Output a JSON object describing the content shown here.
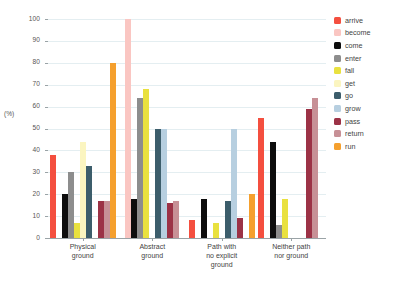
{
  "chart_data": {
    "type": "bar",
    "title": "",
    "subtitle": "",
    "xlabel": "",
    "ylabel": "(%)",
    "ylim": [
      0,
      100
    ],
    "ytick_values": [
      0,
      10,
      20,
      30,
      40,
      50,
      60,
      70,
      80,
      90,
      100
    ],
    "ytick_labels": [
      "0",
      "10",
      "20",
      "30",
      "40",
      "50",
      "60",
      "70",
      "80",
      "90",
      "100"
    ],
    "grid": true,
    "legend_position": "right",
    "categories": [
      "Physical ground",
      "Abstract ground",
      "Path with no explicit ground",
      "Neither path nor ground"
    ],
    "category_lines": [
      [
        "Physical",
        "ground"
      ],
      [
        "Abstract",
        "ground"
      ],
      [
        "Path with",
        "no explicit",
        "ground"
      ],
      [
        "Neither path",
        "nor ground"
      ]
    ],
    "series": [
      {
        "name": "arrive",
        "color": "#f44f3f",
        "values": [
          38,
          0,
          8,
          55
        ]
      },
      {
        "name": "become",
        "color": "#fac6c2",
        "values": [
          0,
          100,
          0,
          0
        ]
      },
      {
        "name": "come",
        "color": "#0d0d0d",
        "values": [
          20,
          18,
          18,
          44
        ]
      },
      {
        "name": "enter",
        "color": "#8d8d8d",
        "values": [
          30,
          64,
          0,
          6
        ]
      },
      {
        "name": "fall",
        "color": "#e9e13f",
        "values": [
          7,
          68,
          7,
          18
        ]
      },
      {
        "name": "get",
        "color": "#fbf5c0",
        "values": [
          44,
          0,
          0,
          0
        ]
      },
      {
        "name": "go",
        "color": "#3c5d6b",
        "values": [
          33,
          50,
          17,
          0
        ]
      },
      {
        "name": "grow",
        "color": "#b7cfe0",
        "values": [
          0,
          50,
          50,
          0
        ]
      },
      {
        "name": "pass",
        "color": "#9c3246",
        "values": [
          17,
          16,
          9,
          59
        ]
      },
      {
        "name": "return",
        "color": "#c79096",
        "values": [
          17,
          17,
          0,
          64
        ]
      },
      {
        "name": "run",
        "color": "#f5a02e",
        "values": [
          80,
          0,
          20,
          0
        ]
      }
    ]
  },
  "legend": {
    "items": [
      {
        "label": "arrive",
        "color": "#f44f3f"
      },
      {
        "label": "become",
        "color": "#fac6c2"
      },
      {
        "label": "come",
        "color": "#0d0d0d"
      },
      {
        "label": "enter",
        "color": "#8d8d8d"
      },
      {
        "label": "fall",
        "color": "#e9e13f"
      },
      {
        "label": "get",
        "color": "#fbf5c0"
      },
      {
        "label": "go",
        "color": "#3c5d6b"
      },
      {
        "label": "grow",
        "color": "#b7cfe0"
      },
      {
        "label": "pass",
        "color": "#9c3246"
      },
      {
        "label": "return",
        "color": "#c79096"
      },
      {
        "label": "run",
        "color": "#f5a02e"
      }
    ]
  }
}
